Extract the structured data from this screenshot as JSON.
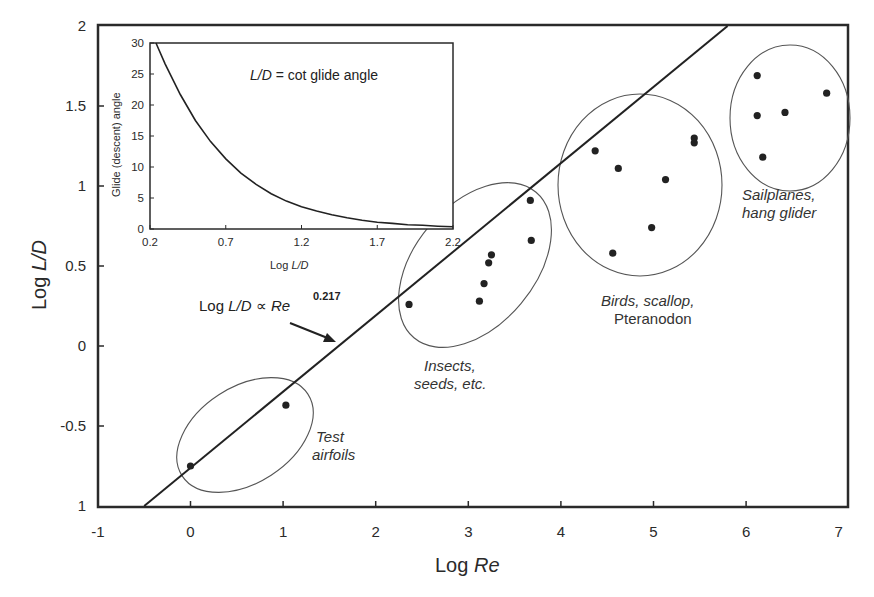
{
  "chart_data": {
    "type": "scatter",
    "title": "",
    "xlabel": "Log Re",
    "ylabel": "Log L/D",
    "xlabel_parts": {
      "prefix": "Log ",
      "italic": "Re"
    },
    "ylabel_parts": {
      "prefix": "Log ",
      "italic": "L/D"
    },
    "xlim": [
      -1,
      7
    ],
    "ylim": [
      -1,
      2
    ],
    "x_ticks": [
      "-1",
      "0",
      "1",
      "2",
      "3",
      "4",
      "5",
      "6",
      "7"
    ],
    "y_ticks": [
      "1",
      "-0.5",
      "0",
      "0.5",
      "1",
      "1.5",
      "2"
    ],
    "y_tick_values": [
      -1,
      -0.5,
      0,
      0.5,
      1,
      1.5,
      2
    ],
    "grid": false,
    "series": [
      {
        "name": "Test airfoils",
        "label_lines": [
          "Test",
          "airfoils"
        ],
        "points": [
          [
            0.0,
            -0.75
          ],
          [
            1.03,
            -0.37
          ]
        ]
      },
      {
        "name": "Insects, seeds, etc.",
        "label_lines": [
          "Insects,",
          "seeds, etc."
        ],
        "points": [
          [
            2.36,
            0.26
          ],
          [
            3.12,
            0.28
          ],
          [
            3.17,
            0.39
          ],
          [
            3.22,
            0.52
          ],
          [
            3.25,
            0.57
          ],
          [
            3.67,
            0.91
          ],
          [
            3.68,
            0.66
          ]
        ]
      },
      {
        "name": "Birds, scallop, Pteranodon",
        "label_lines": [
          "Birds, scallop,",
          "Pteranodon"
        ],
        "points": [
          [
            4.37,
            1.22
          ],
          [
            4.62,
            1.11
          ],
          [
            5.13,
            1.04
          ],
          [
            4.56,
            0.58
          ],
          [
            4.98,
            0.74
          ],
          [
            5.44,
            1.3
          ],
          [
            5.44,
            1.27
          ]
        ]
      },
      {
        "name": "Sailplanes, hang glider",
        "label_lines": [
          "Sailplanes,",
          "hang glider"
        ],
        "points": [
          [
            6.12,
            1.69
          ],
          [
            6.12,
            1.44
          ],
          [
            6.42,
            1.46
          ],
          [
            6.87,
            1.58
          ],
          [
            6.18,
            1.18
          ]
        ]
      }
    ],
    "fit_line": {
      "label_prefix": "Log ",
      "label_italic1": "L/D",
      "label_mid": " ∝ ",
      "label_italic2": "Re",
      "exponent": "0.217",
      "from": [
        -0.5,
        -1.0
      ],
      "to": [
        5.8,
        2.0
      ]
    },
    "inset": {
      "type": "line",
      "xlabel_prefix": "Log ",
      "xlabel_italic": "L/D",
      "ylabel": "Glide (descent) angle",
      "annotation_italic": "L/D",
      "annotation_rest": " = cot glide angle",
      "xlim": [
        0.2,
        2.2
      ],
      "ylim": [
        0,
        30
      ],
      "x_ticks": [
        "0.2",
        "0.7",
        "1.2",
        "1.7",
        "2.2"
      ],
      "y_ticks": [
        "0",
        "5",
        "10",
        "15",
        "20",
        "25",
        "30"
      ],
      "curve": {
        "x": [
          0.2,
          0.25,
          0.3,
          0.4,
          0.5,
          0.6,
          0.7,
          0.8,
          0.9,
          1.0,
          1.1,
          1.2,
          1.3,
          1.4,
          1.5,
          1.6,
          1.7,
          1.8,
          1.9,
          2.0,
          2.1,
          2.2
        ],
        "y": [
          32.2,
          29.4,
          26.6,
          21.7,
          17.5,
          14.1,
          11.3,
          9.0,
          7.2,
          5.7,
          4.5,
          3.6,
          2.9,
          2.3,
          1.8,
          1.4,
          1.1,
          0.9,
          0.7,
          0.6,
          0.45,
          0.36
        ]
      }
    }
  }
}
